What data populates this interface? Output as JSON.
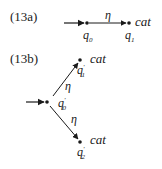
{
  "diagrams": [
    {
      "id_label": "(13a)",
      "states": [
        {
          "name": "q",
          "sub": "0",
          "prime": false,
          "output": ""
        },
        {
          "name": "q",
          "sub": "1",
          "prime": false,
          "output": "cat"
        }
      ],
      "transitions": [
        {
          "from": "q0",
          "to": "q1",
          "label": "η"
        }
      ],
      "start_state": "q0"
    },
    {
      "id_label": "(13b)",
      "states": [
        {
          "name": "q",
          "sub": "0",
          "prime": true,
          "output": ""
        },
        {
          "name": "q",
          "sub": "1",
          "prime": true,
          "output": "cat"
        },
        {
          "name": "q",
          "sub": "2",
          "prime": true,
          "output": "cat"
        }
      ],
      "transitions": [
        {
          "from": "q0'",
          "to": "q1'",
          "label": "η"
        },
        {
          "from": "q0'",
          "to": "q2'",
          "label": "η"
        }
      ],
      "start_state": "q0'"
    }
  ],
  "text": {
    "a_label": "(13a)",
    "b_label": "(13b)",
    "eta": "η",
    "cat": "cat",
    "q": "q",
    "s0": "0",
    "s1": "1",
    "s2": "2",
    "prime": "′"
  }
}
